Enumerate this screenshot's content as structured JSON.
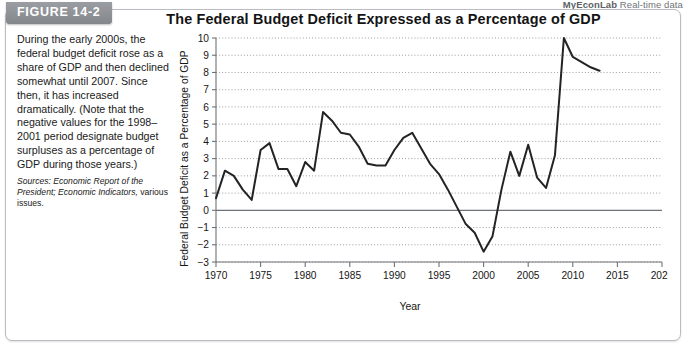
{
  "figure": {
    "banner_label": "FIGURE 14-2"
  },
  "myeconlab": {
    "brand": "MyEconLab",
    "suffix": " Real-time data"
  },
  "caption": {
    "body": "During the early 2000s, the federal budget deficit rose as a share of GDP and then declined somewhat until 2007. Since then, it has increased dramatically. (Note that the negative values for the 1998–2001 period designate budget surpluses as a percentage of GDP during those years.)",
    "sources_prefix": "Sources: ",
    "sources_italic": "Economic Report of the President; Economic Indicators,",
    "sources_tail": " various issues."
  },
  "chart_data": {
    "type": "line",
    "title": "The Federal Budget Deficit Expressed as a Percentage of GDP",
    "xlabel": "Year",
    "ylabel": "Federal Budget Deficit as a Percentage of GDP",
    "xlim": [
      1970,
      2020
    ],
    "ylim": [
      -3,
      10
    ],
    "xticks": [
      1970,
      1975,
      1980,
      1985,
      1990,
      1995,
      2000,
      2005,
      2010,
      2015,
      2020
    ],
    "yticks": [
      -3,
      -2,
      -1,
      0,
      1,
      2,
      3,
      4,
      5,
      6,
      7,
      8,
      9,
      10
    ],
    "ytick_labels": [
      "−3",
      "−2",
      "−1",
      "0",
      "1",
      "2",
      "3",
      "4",
      "5",
      "6",
      "7",
      "8",
      "9",
      "10"
    ],
    "grid": "horizontal-dotted",
    "zero_line": true,
    "legend": null,
    "series": [
      {
        "name": "Federal budget deficit as a percentage of GDP",
        "color": "#232323",
        "x": [
          1970,
          1971,
          1972,
          1973,
          1974,
          1975,
          1976,
          1977,
          1978,
          1979,
          1980,
          1981,
          1982,
          1983,
          1984,
          1985,
          1986,
          1987,
          1988,
          1989,
          1990,
          1991,
          1992,
          1993,
          1994,
          1995,
          1996,
          1997,
          1998,
          1999,
          2000,
          2001,
          2002,
          2003,
          2004,
          2005,
          2006,
          2007,
          2008,
          2009,
          2010,
          2011,
          2012,
          2013
        ],
        "y": [
          0.7,
          2.3,
          2.0,
          1.2,
          0.6,
          3.5,
          3.9,
          2.4,
          2.4,
          1.4,
          2.8,
          2.3,
          5.7,
          5.2,
          4.5,
          4.4,
          3.7,
          2.7,
          2.6,
          2.6,
          3.5,
          4.2,
          4.5,
          3.6,
          2.7,
          2.1,
          1.2,
          0.2,
          -0.8,
          -1.3,
          -2.4,
          -1.5,
          1.2,
          3.4,
          2.0,
          3.8,
          1.9,
          1.3,
          3.2,
          10.0,
          8.9,
          8.6,
          8.3,
          8.1
        ]
      }
    ],
    "annotations": []
  }
}
